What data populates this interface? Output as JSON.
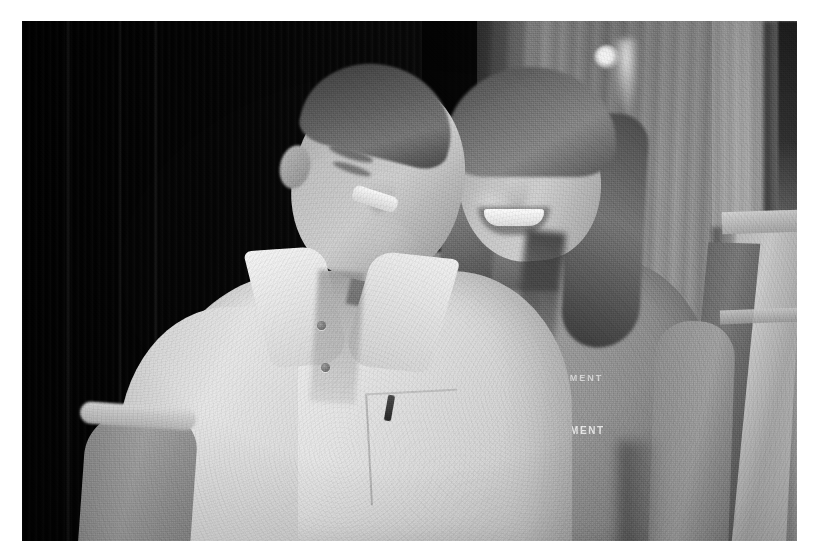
{
  "document": {
    "kind": "scanned-photograph",
    "medium": "black-and-white photocopy",
    "page_background": "#ffffff",
    "width_px": 827,
    "height_px": 559
  },
  "photo": {
    "frame": {
      "left_px": 22,
      "top_px": 21,
      "width_px": 775,
      "height_px": 520,
      "border_color": "#ffffff"
    },
    "caption": "",
    "palette": {
      "deep_black": "#0c0c0c",
      "dark_gray": "#3a3a3a",
      "mid_gray": "#8d8d8d",
      "light_gray": "#c8c8c8",
      "highlight_white": "#f4f4f4"
    },
    "subjects": [
      {
        "id": "man",
        "label": "Man in white polo shirt",
        "position": "left",
        "expression": "laughing, eyes closed, head tilted toward woman",
        "clothing": "white short-sleeve polo shirt, buttons open at placket",
        "tone": "light"
      },
      {
        "id": "woman",
        "label": "Woman in gray t-shirt",
        "position": "right",
        "expression": "smiling broadly at camera",
        "clothing": "gray graphic t-shirt with chest logo",
        "hair": "long wavy hair past shoulders",
        "tone": "mid"
      }
    ],
    "background": {
      "left": "dark unlit interior wall / doorway with faint vertical streaks",
      "right": "light gray drapery panel",
      "light_source": "small bright ceiling light near upper right",
      "furniture": "wooden chair back at far right edge"
    },
    "shirt_logo": {
      "arc_text": "ENTERTAINMENT",
      "mark": "star-burst emblem",
      "sub_text": "and",
      "bottom_text": "ENTERTAINMENT"
    }
  }
}
